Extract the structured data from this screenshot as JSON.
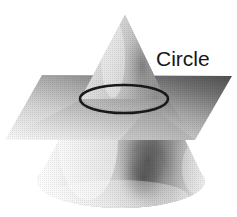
{
  "figure": {
    "name": "conic-section-circle",
    "background_color": "#ffffff",
    "labels": [
      {
        "id": "circle",
        "text": "Circle",
        "color": "#161616",
        "x": 156,
        "y": 48,
        "font_size": 21
      }
    ],
    "shapes": {
      "cone": {
        "name": "cone",
        "apex": {
          "x": 125,
          "y": 15
        },
        "base_center": {
          "x": 121,
          "y": 182
        },
        "base_radius_x": 84,
        "base_radius_y": 27,
        "shading": "halftone grayscale, light on left, dark band right of center",
        "highlight_color": "#f7f7f7",
        "midtone_color": "#bdbdbd",
        "shadow_color": "#6b6b6b"
      },
      "plane": {
        "name": "cutting-plane",
        "corners": [
          {
            "x": 42,
            "y": 75
          },
          {
            "x": 232,
            "y": 76
          },
          {
            "x": 195,
            "y": 140
          },
          {
            "x": 5,
            "y": 140
          }
        ],
        "gradient_from": "#5e5e5e",
        "gradient_to": "#f2f2f2",
        "shading": "darker at top-right, lighter toward bottom-left"
      },
      "intersection_curve": {
        "name": "circle-cross-section",
        "type": "ellipse",
        "center": {
          "x": 124,
          "y": 99
        },
        "radius_x": 44,
        "radius_y": 14,
        "stroke_color": "#1a1a1a",
        "stroke_width": 2.6,
        "fill": "none"
      }
    }
  }
}
